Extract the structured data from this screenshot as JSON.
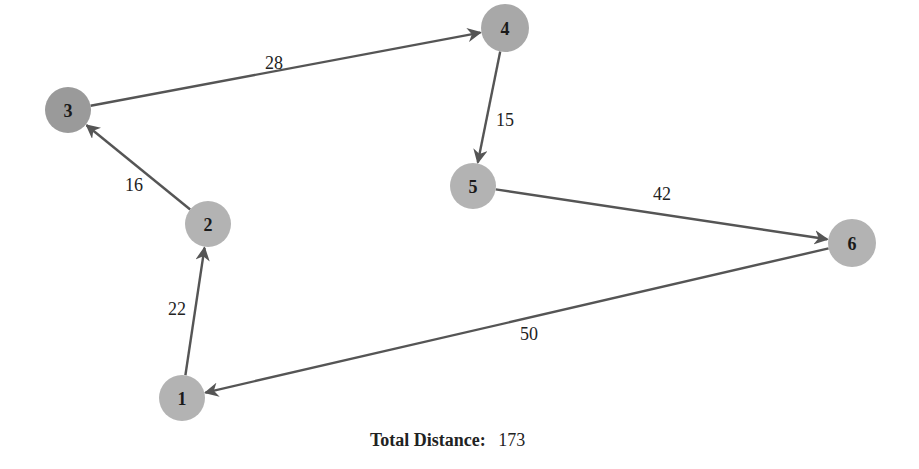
{
  "graph": {
    "nodes": [
      {
        "id": "1",
        "label": "1",
        "x": 182,
        "y": 398,
        "r": 23,
        "fill": "#b3b3b3"
      },
      {
        "id": "2",
        "label": "2",
        "x": 208,
        "y": 224,
        "r": 23,
        "fill": "#b3b3b3"
      },
      {
        "id": "3",
        "label": "3",
        "x": 68,
        "y": 110,
        "r": 23,
        "fill": "#9a9a9a"
      },
      {
        "id": "4",
        "label": "4",
        "x": 505,
        "y": 28,
        "r": 24,
        "fill": "#a8a8a8"
      },
      {
        "id": "5",
        "label": "5",
        "x": 473,
        "y": 186,
        "r": 23,
        "fill": "#b3b3b3"
      },
      {
        "id": "6",
        "label": "6",
        "x": 852,
        "y": 243,
        "r": 24,
        "fill": "#b3b3b3"
      }
    ],
    "edges": [
      {
        "from": "1",
        "to": "2",
        "weight": "22",
        "label_x": 177,
        "label_y": 309
      },
      {
        "from": "2",
        "to": "3",
        "weight": "16",
        "label_x": 134,
        "label_y": 185
      },
      {
        "from": "3",
        "to": "4",
        "weight": "28",
        "label_x": 274,
        "label_y": 63
      },
      {
        "from": "4",
        "to": "5",
        "weight": "15",
        "label_x": 505,
        "label_y": 120
      },
      {
        "from": "5",
        "to": "6",
        "weight": "42",
        "label_x": 662,
        "label_y": 194
      },
      {
        "from": "6",
        "to": "1",
        "weight": "50",
        "label_x": 529,
        "label_y": 334
      }
    ],
    "edge_color": "#555555"
  },
  "footer": {
    "total_label": "Total Distance:",
    "total_value": "173"
  }
}
